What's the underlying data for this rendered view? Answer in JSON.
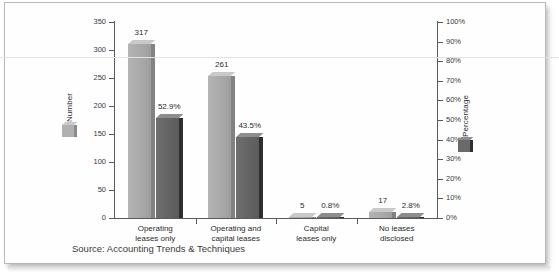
{
  "page": {
    "source_note": "Source: Accounting Trends & Techniques"
  },
  "chart_data": {
    "type": "bar",
    "title": "",
    "subtitle": "",
    "xlabel": "",
    "categories": [
      "Operating\nleases only",
      "Operating and\ncapital leases",
      "Capital\nleases only",
      "No leases\ndisclosed"
    ],
    "category_lines": [
      [
        "Operating",
        "leases only"
      ],
      [
        "Operating and",
        "capital leases"
      ],
      [
        "Capital",
        "leases only"
      ],
      [
        "No leases",
        "disclosed"
      ]
    ],
    "series": [
      {
        "name": "Number",
        "axis": "left",
        "color": "#a8a8a8",
        "values": [
          317,
          261,
          5,
          17
        ],
        "labels": [
          "317",
          "261",
          "5",
          "17"
        ]
      },
      {
        "name": "Percentage",
        "axis": "right",
        "color": "#636363",
        "values": [
          52.9,
          43.5,
          0.8,
          2.8
        ],
        "labels": [
          "52.9%",
          "43.5%",
          "0.8%",
          "2.8%"
        ]
      }
    ],
    "left_axis": {
      "label": "Number",
      "ylim": [
        0,
        350
      ],
      "ticks": [
        0,
        50,
        100,
        150,
        200,
        250,
        300,
        350
      ],
      "tick_labels": [
        "0",
        "50",
        "100",
        "150",
        "200",
        "250",
        "300",
        "350"
      ]
    },
    "right_axis": {
      "label": "Percentage",
      "ylim": [
        0,
        100
      ],
      "ticks": [
        0,
        10,
        20,
        30,
        40,
        50,
        60,
        70,
        80,
        90,
        100
      ],
      "tick_labels": [
        "0%",
        "10%",
        "20%",
        "30%",
        "40%",
        "50%",
        "60%",
        "70%",
        "80%",
        "90%",
        "100%"
      ]
    },
    "grid": false,
    "legend_position": "left-and-right-inside"
  }
}
